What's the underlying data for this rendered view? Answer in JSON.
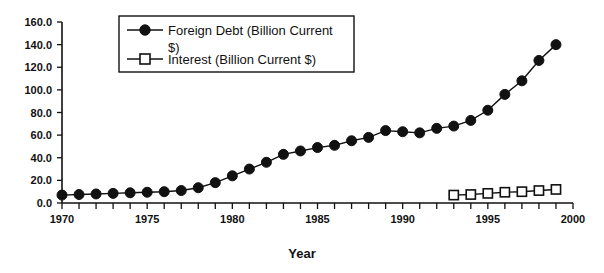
{
  "chart_data": {
    "type": "line",
    "title": "",
    "xlabel": "Year",
    "ylabel": "",
    "xlim": [
      1970,
      2000
    ],
    "ylim": [
      0.0,
      160.0
    ],
    "grid": false,
    "legend_position": "top-left-inside",
    "x_tick_labels": [
      "1970",
      "1975",
      "1980",
      "1985",
      "1990",
      "1995",
      "2000"
    ],
    "x_tick_label_values": [
      1970,
      1975,
      1980,
      1985,
      1990,
      1995,
      2000
    ],
    "x_minor_ticks_every": 1,
    "y_tick_labels": [
      "0.0",
      "20.0",
      "40.0",
      "60.0",
      "80.0",
      "100.0",
      "120.0",
      "140.0",
      "160.0"
    ],
    "y_tick_label_values": [
      0.0,
      20.0,
      40.0,
      60.0,
      80.0,
      100.0,
      120.0,
      140.0,
      160.0
    ],
    "x": [
      1970,
      1971,
      1972,
      1973,
      1974,
      1975,
      1976,
      1977,
      1978,
      1979,
      1980,
      1981,
      1982,
      1983,
      1984,
      1985,
      1986,
      1987,
      1988,
      1989,
      1990,
      1991,
      1992,
      1993,
      1994,
      1995,
      1996,
      1997,
      1998,
      1999
    ],
    "series": [
      {
        "name": "Foreign Debt (Billion Current $)",
        "marker": "filled-circle",
        "color": "#111111",
        "x": [
          1970,
          1971,
          1972,
          1973,
          1974,
          1975,
          1976,
          1977,
          1978,
          1979,
          1980,
          1981,
          1982,
          1983,
          1984,
          1985,
          1986,
          1987,
          1988,
          1989,
          1990,
          1991,
          1992,
          1993,
          1994,
          1995,
          1996,
          1997,
          1998,
          1999
        ],
        "values": [
          7,
          7.5,
          8,
          8.5,
          9,
          9.5,
          10,
          11,
          13.5,
          18,
          24,
          30,
          36,
          43,
          46,
          49,
          51,
          55,
          58,
          64,
          63,
          62,
          66,
          68,
          73,
          82,
          96,
          108,
          126,
          140
        ]
      },
      {
        "name": "Interest (Billion Current $)",
        "marker": "open-square",
        "color": "#111111",
        "x": [
          1993,
          1994,
          1995,
          1996,
          1997,
          1998,
          1999
        ],
        "values": [
          7,
          7.5,
          8.5,
          9.5,
          10,
          11,
          12
        ]
      }
    ],
    "legend_entries": [
      "Foreign Debt (Billion Current $)",
      "Interest (Billion Current $)"
    ]
  },
  "axes": {
    "x_title": "Year"
  },
  "legend": {
    "entry_1_label": "Foreign Debt (Billion Current $)",
    "entry_2_label": "Interest (Billion Current $)"
  }
}
